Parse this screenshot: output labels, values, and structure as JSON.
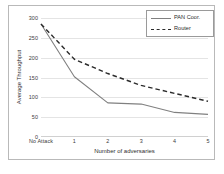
{
  "chart_data": {
    "type": "line",
    "title": "",
    "xlabel": "Number of adversaries",
    "ylabel": "Average Throughput",
    "categories": [
      "No Attack",
      "1",
      "2",
      "3",
      "4",
      "5"
    ],
    "ylim": [
      0,
      300
    ],
    "yticks": [
      0,
      50,
      100,
      150,
      200,
      250,
      300
    ],
    "ytick_labels": [
      "0",
      "50",
      "100",
      "150",
      "200",
      "250",
      "300"
    ],
    "grid": true,
    "legend_position": "top-right",
    "series": [
      {
        "name": "PAN Coor.",
        "style": "solid",
        "color": "#808080",
        "values": [
          285,
          152,
          86,
          83,
          62,
          57
        ]
      },
      {
        "name": "Router",
        "style": "dashed",
        "color": "#2b2b2b",
        "values": [
          285,
          196,
          160,
          130,
          110,
          90
        ]
      }
    ]
  },
  "legend": {
    "items": [
      {
        "label": "PAN Coor."
      },
      {
        "label": "Router"
      }
    ]
  },
  "colors": {
    "pan_coor": "#808080",
    "router": "#2b2b2b",
    "grid": "#e4e4e4",
    "frame": "#b9b9b9",
    "text": "#2e2e2e"
  }
}
